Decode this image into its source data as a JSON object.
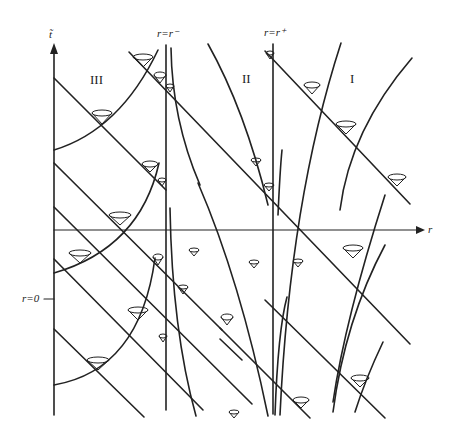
{
  "diagram": {
    "title": "",
    "axes": {
      "vertical_label": "t̃",
      "horizontal_label": "r",
      "origin_label": "r=0"
    },
    "horizons": [
      {
        "label": "r=r⁻"
      },
      {
        "label": "r=r⁺"
      }
    ],
    "regions": [
      {
        "label": "III"
      },
      {
        "label": "II"
      },
      {
        "label": "I"
      }
    ],
    "colors": {
      "stroke": "#222222",
      "background": "#ffffff"
    }
  }
}
